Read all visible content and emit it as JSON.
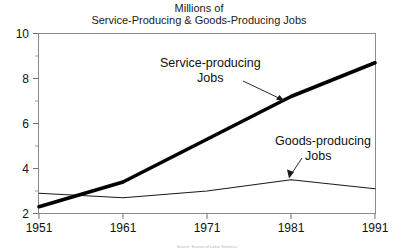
{
  "chart_data": {
    "type": "line",
    "title": "Millions of Service-Producing & Goods-Producing Jobs",
    "title_lines": [
      "Millions of",
      "Service-Producing & Goods-Producing Jobs"
    ],
    "xlabel": "",
    "ylabel": "",
    "xlim": [
      1951,
      1991
    ],
    "ylim": [
      2,
      10
    ],
    "y_major_ticks": [
      2,
      4,
      6,
      8,
      10
    ],
    "y_minor_ticks": [
      3,
      5,
      7,
      9
    ],
    "y_tick_labels": [
      "2",
      "4",
      "6",
      "8",
      "10"
    ],
    "x_ticks": [
      1951,
      1961,
      1971,
      1981,
      1991
    ],
    "x_tick_labels": [
      "1951",
      "1961",
      "1971",
      "1981",
      "1991"
    ],
    "grid": false,
    "legend": "inline-annotations",
    "x": [
      1951,
      1961,
      1971,
      1981,
      1991
    ],
    "series": [
      {
        "name": "Service-producing Jobs",
        "style": "thick",
        "color": "#000000",
        "values": [
          2.3,
          3.4,
          5.3,
          7.2,
          8.7
        ]
      },
      {
        "name": "Goods-producing Jobs",
        "style": "thin",
        "color": "#1a1a1a",
        "values": [
          2.9,
          2.7,
          3.0,
          3.5,
          3.1
        ]
      }
    ],
    "annotations": [
      {
        "id": "service-annotation",
        "lines": [
          "Service-producing",
          "Jobs"
        ],
        "points_to_year": 1979,
        "points_to_value": 6.9
      },
      {
        "id": "goods-annotation",
        "lines": [
          "Goods-producing",
          "Jobs"
        ],
        "points_to_year": 1981,
        "points_to_value": 3.5
      }
    ],
    "source_note": "Source: Bureau of Labor Statistics"
  }
}
